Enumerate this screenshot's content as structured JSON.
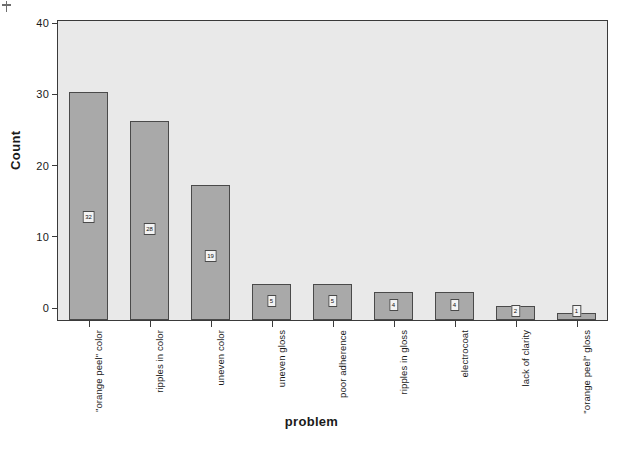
{
  "chart_data": {
    "type": "bar",
    "title": "",
    "xlabel": "problem",
    "ylabel": "Count",
    "categories": [
      "\"orange peel\" color",
      "ripples in color",
      "uneven color",
      "uneven gloss",
      "poor adherence",
      "ripples in gloss",
      "electrocoat",
      "lack of clarity",
      "\"orange peel\" gloss"
    ],
    "values": [
      32,
      28,
      19,
      5,
      5,
      4,
      4,
      2,
      1
    ],
    "data_labels": [
      "32",
      "28",
      "19",
      "5",
      "5",
      "4",
      "4",
      "2",
      "1"
    ],
    "ylim": [
      0,
      42
    ],
    "yticks": [
      0,
      10,
      20,
      30,
      40
    ],
    "ytick_labels": [
      "0",
      "10",
      "20",
      "30",
      "40"
    ],
    "grid": false,
    "legend": null,
    "colors": {
      "bar_fill": "#a9a9a9",
      "bar_border": "#4a4a4a",
      "plot_background": "#e9e9e9",
      "frame": "#3a3a3a",
      "text": "#1a1a1a"
    }
  }
}
